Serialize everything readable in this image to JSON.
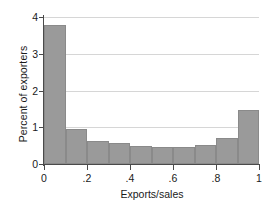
{
  "chart_data": {
    "type": "bar",
    "title": "",
    "subtitle": "",
    "xlabel": "Exports/sales",
    "ylabel": "Percent of exporters",
    "xlim": [
      0,
      1
    ],
    "ylim": [
      0,
      4
    ],
    "grid": true,
    "legend": null,
    "bar_color": "#9a9a9a",
    "bin_width": 0.1,
    "xticks": [
      "0",
      ".2",
      ".4",
      ".6",
      ".8",
      "1"
    ],
    "xtick_values": [
      0,
      0.2,
      0.4,
      0.6,
      0.8,
      1
    ],
    "yticks": [
      "0",
      "1",
      "2",
      "3",
      "4"
    ],
    "ytick_values": [
      0,
      1,
      2,
      3,
      4
    ],
    "bin_edges": [
      0,
      0.1,
      0.2,
      0.3,
      0.4,
      0.5,
      0.6,
      0.7,
      0.8,
      0.9,
      1.0
    ],
    "categories": [
      "0-0.1",
      "0.1-0.2",
      "0.2-0.3",
      "0.3-0.4",
      "0.4-0.5",
      "0.5-0.6",
      "0.6-0.7",
      "0.7-0.8",
      "0.8-0.9",
      "0.9-1.0"
    ],
    "values": [
      3.78,
      0.95,
      0.63,
      0.57,
      0.48,
      0.46,
      0.47,
      0.53,
      0.72,
      1.47
    ]
  }
}
